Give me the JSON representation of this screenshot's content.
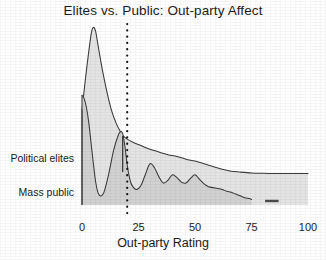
{
  "chart_data": {
    "type": "area",
    "title": "Elites vs. Public: Out-party Affect",
    "xlabel": "Out-party Rating",
    "ylabel": "",
    "xlim": [
      0,
      100
    ],
    "ylim": [
      0,
      1
    ],
    "grid": false,
    "legend_position": "left-inline",
    "xticks": [
      "0",
      "25",
      "50",
      "75",
      "100"
    ],
    "xtick_values": [
      0,
      25,
      50,
      75,
      100
    ],
    "annotations": [
      {
        "name": "reference-line",
        "type": "vertical-dotted",
        "x": 20,
        "label": ""
      },
      {
        "name": "marker-line",
        "type": "vertical-solid",
        "x": 18,
        "label": ""
      }
    ],
    "series": [
      {
        "name": "Political elites",
        "label": "Political elites",
        "fill": "#e4e4e4",
        "stroke": "#3a3a3a",
        "x": [
          0,
          2,
          4,
          5,
          6,
          7,
          9,
          11,
          13,
          15,
          17,
          18,
          20,
          23,
          26,
          30,
          34,
          38,
          42,
          46,
          50,
          54,
          58,
          62,
          66,
          70,
          75,
          80,
          85,
          90,
          95,
          100
        ],
        "y": [
          0.52,
          0.74,
          0.93,
          0.97,
          0.95,
          0.88,
          0.74,
          0.62,
          0.52,
          0.45,
          0.4,
          0.38,
          0.36,
          0.34,
          0.325,
          0.305,
          0.29,
          0.275,
          0.265,
          0.25,
          0.24,
          0.225,
          0.21,
          0.195,
          0.185,
          0.18,
          0.175,
          0.173,
          0.172,
          0.172,
          0.172,
          0.172
        ]
      },
      {
        "name": "Mass public",
        "label": "Mass public",
        "fill": "#d2d2d2",
        "stroke": "#3a3a3a",
        "x": [
          0,
          1,
          2,
          3,
          4,
          5,
          6,
          7,
          8,
          9,
          10,
          12,
          14,
          16,
          17,
          18,
          19,
          20,
          21,
          22,
          24,
          26,
          28,
          30,
          32,
          34,
          36,
          38,
          40,
          42,
          44,
          46,
          48,
          50,
          52,
          54,
          56,
          58,
          60,
          62,
          64,
          66,
          68,
          70,
          72,
          74,
          75
        ],
        "y": [
          0.6,
          0.58,
          0.53,
          0.45,
          0.34,
          0.23,
          0.13,
          0.07,
          0.05,
          0.055,
          0.08,
          0.18,
          0.3,
          0.38,
          0.4,
          0.39,
          0.32,
          0.22,
          0.15,
          0.11,
          0.085,
          0.105,
          0.165,
          0.225,
          0.205,
          0.155,
          0.12,
          0.135,
          0.165,
          0.15,
          0.125,
          0.12,
          0.145,
          0.165,
          0.14,
          0.115,
          0.1,
          0.095,
          0.09,
          0.085,
          0.075,
          0.07,
          0.06,
          0.05,
          0.04,
          0.035,
          0.03
        ]
      },
      {
        "name": "Mass public tail segment",
        "label": "",
        "fill": "#4a4a4a",
        "stroke": "#3a3a3a",
        "x": [
          81,
          87
        ],
        "y": [
          0.022,
          0.022
        ]
      }
    ]
  }
}
